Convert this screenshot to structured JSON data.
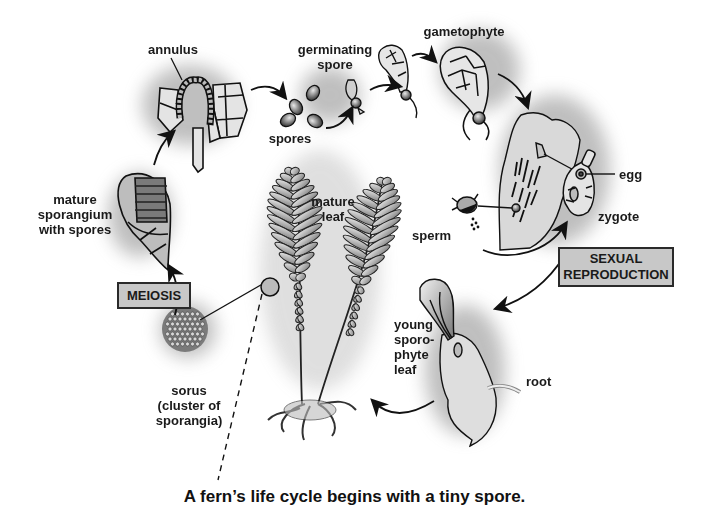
{
  "diagram": {
    "title_caption": "A fern’s life cycle begins with a tiny spore.",
    "labels": {
      "annulus": "annulus",
      "germinating_spore": [
        "germinating",
        "spore"
      ],
      "spores": "spores",
      "gametophyte": "gametophyte",
      "egg": "egg",
      "zygote": "zygote",
      "sperm": "sperm",
      "mature_sporangium": [
        "mature",
        "sporangium",
        "with spores"
      ],
      "mature_leaf": [
        "mature",
        "leaf"
      ],
      "young_sporophyte_leaf": [
        "young",
        "sporo-",
        "phyte",
        "leaf"
      ],
      "root": "root",
      "sorus": [
        "sorus",
        "(cluster of",
        "sporangia)"
      ]
    },
    "boxes": {
      "meiosis": "MEIOSIS",
      "sexual_reproduction": [
        "SEXUAL",
        "REPRODUCTION"
      ]
    },
    "stages": [
      "mature sporangium with spores",
      "annulus",
      "spores",
      "germinating spore",
      "gametophyte",
      "sexual reproduction",
      "young sporophyte leaf",
      "mature leaf",
      "sorus",
      "meiosis"
    ],
    "colors": {
      "ink": "#1a1a1a",
      "box_fill": "#c8c8c8",
      "tissue_fill": "#d9d9d9",
      "shadow": "#9a9a9a"
    }
  }
}
